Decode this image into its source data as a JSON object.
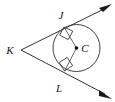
{
  "figure": {
    "kind": "geometry-diagram",
    "background_color": "#ffffff",
    "line_color": "#1a1a1a",
    "circle": {
      "center_label": "C",
      "center_x": 76.5,
      "center_y": 48,
      "radius": 23.5,
      "stroke_color": "#444444"
    },
    "points": [
      {
        "label": "K",
        "x": 21,
        "y": 50,
        "label_x": 10,
        "label_y": 52,
        "role": "external-vertex"
      },
      {
        "label": "J",
        "x": 64,
        "y": 27,
        "label_x": 58,
        "label_y": 20,
        "role": "upper-tangent-point"
      },
      {
        "label": "C",
        "x": 76.5,
        "y": 48,
        "label_x": 83,
        "label_y": 51,
        "role": "circle-center"
      },
      {
        "label": "L",
        "x": 64.5,
        "y": 71,
        "label_x": 56,
        "label_y": 93,
        "role": "lower-tangent-point"
      }
    ],
    "rays": [
      {
        "name": "ray-KJ",
        "from": "K",
        "through": "J",
        "arrow_at": {
          "x": 110,
          "y": 6
        }
      },
      {
        "name": "ray-KL",
        "from": "K",
        "through": "L",
        "arrow_at": {
          "x": 110,
          "y": 96
        }
      }
    ],
    "segments": [
      {
        "name": "radius-CJ",
        "from": "C",
        "to": "J"
      },
      {
        "name": "radius-CL",
        "from": "C",
        "to": "L"
      }
    ],
    "right_angle_marks": [
      {
        "name": "right-angle-at-J",
        "at": "J",
        "size": 9
      },
      {
        "name": "right-angle-at-L",
        "at": "L",
        "size": 9
      }
    ],
    "labels": {
      "k": "K",
      "j": "J",
      "c": "C",
      "l": "L"
    }
  }
}
